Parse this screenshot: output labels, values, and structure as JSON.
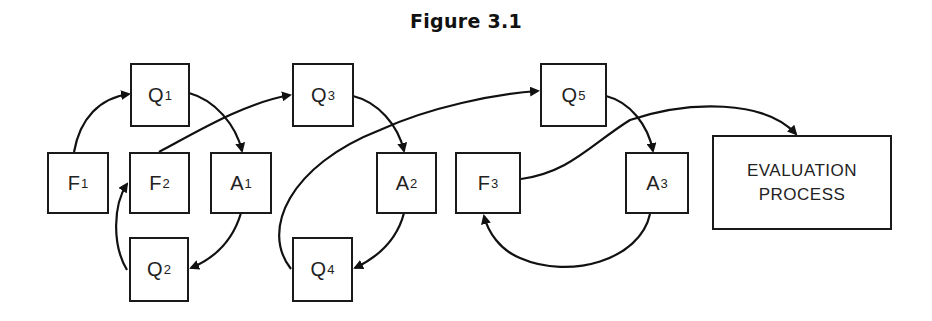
{
  "title": "Figure 3.1",
  "nodes": {
    "F1": {
      "letter": "F",
      "sub": "1"
    },
    "F2": {
      "letter": "F",
      "sub": "2"
    },
    "F3": {
      "letter": "F",
      "sub": "3"
    },
    "Q1": {
      "letter": "Q",
      "sub": "1"
    },
    "Q2": {
      "letter": "Q",
      "sub": "2"
    },
    "Q3": {
      "letter": "Q",
      "sub": "3"
    },
    "Q4": {
      "letter": "Q",
      "sub": "4"
    },
    "Q5": {
      "letter": "Q",
      "sub": "5"
    },
    "A1": {
      "letter": "A",
      "sub": "1"
    },
    "A2": {
      "letter": "A",
      "sub": "2"
    },
    "A3": {
      "letter": "A",
      "sub": "3"
    },
    "EVAL": {
      "line1": "EVALUATION",
      "line2": "PROCESS"
    }
  },
  "edges": [
    {
      "from": "F1",
      "to": "Q1"
    },
    {
      "from": "Q1",
      "to": "A1"
    },
    {
      "from": "A1",
      "to": "Q2"
    },
    {
      "from": "Q2",
      "to": "F2"
    },
    {
      "from": "F2",
      "to": "Q3"
    },
    {
      "from": "Q3",
      "to": "A2"
    },
    {
      "from": "A2",
      "to": "Q4"
    },
    {
      "from": "Q4",
      "to": "Q5"
    },
    {
      "from": "Q5",
      "to": "A3"
    },
    {
      "from": "A3",
      "to": "F3"
    },
    {
      "from": "F3",
      "to": "EVAL"
    }
  ]
}
